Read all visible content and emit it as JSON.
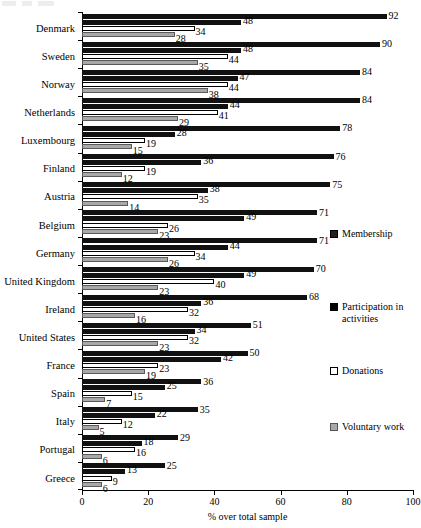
{
  "chart_data": {
    "type": "bar",
    "orientation": "horizontal",
    "title": "",
    "xlabel": "% over total sample",
    "ylabel": "",
    "xlim": [
      0,
      100
    ],
    "xticks": [
      0,
      20,
      40,
      60,
      80,
      100
    ],
    "grid": false,
    "legend_position": "right",
    "categories": [
      "Denmark",
      "Sweden",
      "Norway",
      "Netherlands",
      "Luxembourg",
      "Finland",
      "Austria",
      "Belgium",
      "Germany",
      "United Kingdom",
      "Ireland",
      "United States",
      "France",
      "Spain",
      "Italy",
      "Portugal",
      "Greece"
    ],
    "series": [
      {
        "name": "Membership",
        "color": "#111111",
        "values": [
          92,
          90,
          84,
          84,
          78,
          76,
          75,
          71,
          71,
          70,
          68,
          51,
          50,
          36,
          35,
          29,
          25
        ]
      },
      {
        "name": "Participation in activities",
        "color": "#111111",
        "values": [
          48,
          48,
          47,
          44,
          28,
          36,
          38,
          49,
          44,
          49,
          36,
          34,
          42,
          25,
          22,
          18,
          13
        ]
      },
      {
        "name": "Donations",
        "color": "#ffffff",
        "values": [
          34,
          44,
          44,
          41,
          19,
          19,
          35,
          26,
          34,
          40,
          32,
          32,
          23,
          15,
          12,
          16,
          9
        ]
      },
      {
        "name": "Voluntary work",
        "color": "#a8a8a8",
        "values": [
          28,
          35,
          38,
          29,
          15,
          12,
          14,
          23,
          26,
          23,
          16,
          23,
          19,
          7,
          5,
          6,
          6
        ]
      }
    ]
  },
  "legend": {
    "items": [
      {
        "label": "Membership",
        "key": "membership"
      },
      {
        "label": "Participation in activities",
        "key": "participation"
      },
      {
        "label": "Donations",
        "key": "donations"
      },
      {
        "label": "Voluntary work",
        "key": "voluntary"
      }
    ]
  },
  "axis": {
    "x_title": "% over total sample",
    "tick_labels": [
      "0",
      "20",
      "40",
      "60",
      "80",
      "100"
    ]
  }
}
